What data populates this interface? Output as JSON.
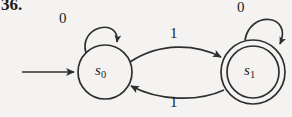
{
  "figure": {
    "exercise_number": "36.",
    "background_color": "#f4f3f1",
    "stroke_color": "#2a2a2a",
    "type": "finite-state-automaton-diagram"
  },
  "automaton": {
    "states": [
      {
        "id": "s0",
        "label": "s",
        "subscript": "0",
        "accepting": false,
        "start": true,
        "cx": 105,
        "cy": 72,
        "r": 27
      },
      {
        "id": "s1",
        "label": "s",
        "subscript": "1",
        "accepting": true,
        "start": false,
        "cx": 253,
        "cy": 72,
        "r": 27,
        "outer_r": 32
      }
    ],
    "transitions": [
      {
        "from": "s0",
        "to": "s0",
        "input": "0",
        "kind": "self-loop"
      },
      {
        "from": "s0",
        "to": "s1",
        "input": "1",
        "kind": "arc-top"
      },
      {
        "from": "s1",
        "to": "s0",
        "input": "1",
        "kind": "arc-bottom"
      },
      {
        "from": "s1",
        "to": "s1",
        "input": "0",
        "kind": "self-loop"
      }
    ],
    "start_arrow": {
      "to": "s0",
      "from_x": 22,
      "to_x": 76,
      "y": 72
    }
  }
}
